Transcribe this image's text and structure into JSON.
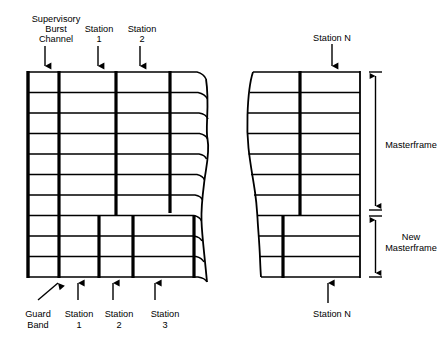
{
  "diagram": {
    "type": "frame-structure",
    "stroke_color": "#000000",
    "background_color": "#ffffff"
  },
  "top_labels": {
    "supervisory": {
      "line1": "Supervisory",
      "line2": "Burst",
      "line3": "Channel"
    },
    "station_1": {
      "line1": "Station",
      "line2": "1"
    },
    "station_2": {
      "line1": "Station",
      "line2": "2"
    },
    "station_n": {
      "line1": "Station N"
    }
  },
  "bottom_labels": {
    "guard_band": {
      "line1": "Guard",
      "line2": "Band"
    },
    "station_1": {
      "line1": "Station",
      "line2": "1"
    },
    "station_2": {
      "line1": "Station",
      "line2": "2"
    },
    "station_3": {
      "line1": "Station",
      "line2": "3"
    },
    "station_n": {
      "line1": "Station N"
    }
  },
  "dimension_labels": {
    "masterframe": {
      "line1": "Masterframe"
    },
    "new_masterframe": {
      "line1": "New",
      "line2": "Masterframe"
    }
  },
  "structure": {
    "left_panel": {
      "rows": 10,
      "upper_block_rows": 7,
      "lower_block_rows": 3,
      "upper_dividers_label": "supervisory + station 1 + station 2 columns",
      "lower_dividers_label": "guard band + station 1 + station 2 + station 3 columns"
    },
    "right_panel": {
      "rows": 10,
      "upper_block_rows": 7,
      "lower_block_rows": 3,
      "upper_divider_label": "station N column",
      "lower_divider_label": "station N column shifted"
    },
    "break": "wavy torn edge between left and right panels"
  }
}
